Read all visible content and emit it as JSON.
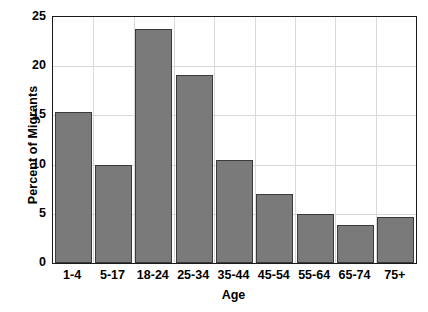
{
  "chart_data": {
    "type": "bar",
    "title": "",
    "xlabel": "Age",
    "ylabel": "Percent of Migrants",
    "categories": [
      "1-4",
      "5-17",
      "18-24",
      "25-34",
      "35-44",
      "45-54",
      "55-64",
      "65-74",
      "75+"
    ],
    "values": [
      15.3,
      10.0,
      23.8,
      19.1,
      10.5,
      7.0,
      5.0,
      3.9,
      4.7
    ],
    "ylim": [
      0,
      25
    ],
    "yticks": [
      0,
      5,
      10,
      15,
      20,
      25
    ],
    "ytick_labels": [
      "0",
      "5",
      "10",
      "15",
      "20",
      "25"
    ],
    "grid": true,
    "grid_axis": "both",
    "legend": false,
    "legend_position": "none",
    "bar_color": "#7a7a7a",
    "bar_edge_color": "#3a3a3a",
    "grid_color": "#d8d8d8",
    "axis_color": "#1a1a1a",
    "background_color": "#ffffff"
  }
}
